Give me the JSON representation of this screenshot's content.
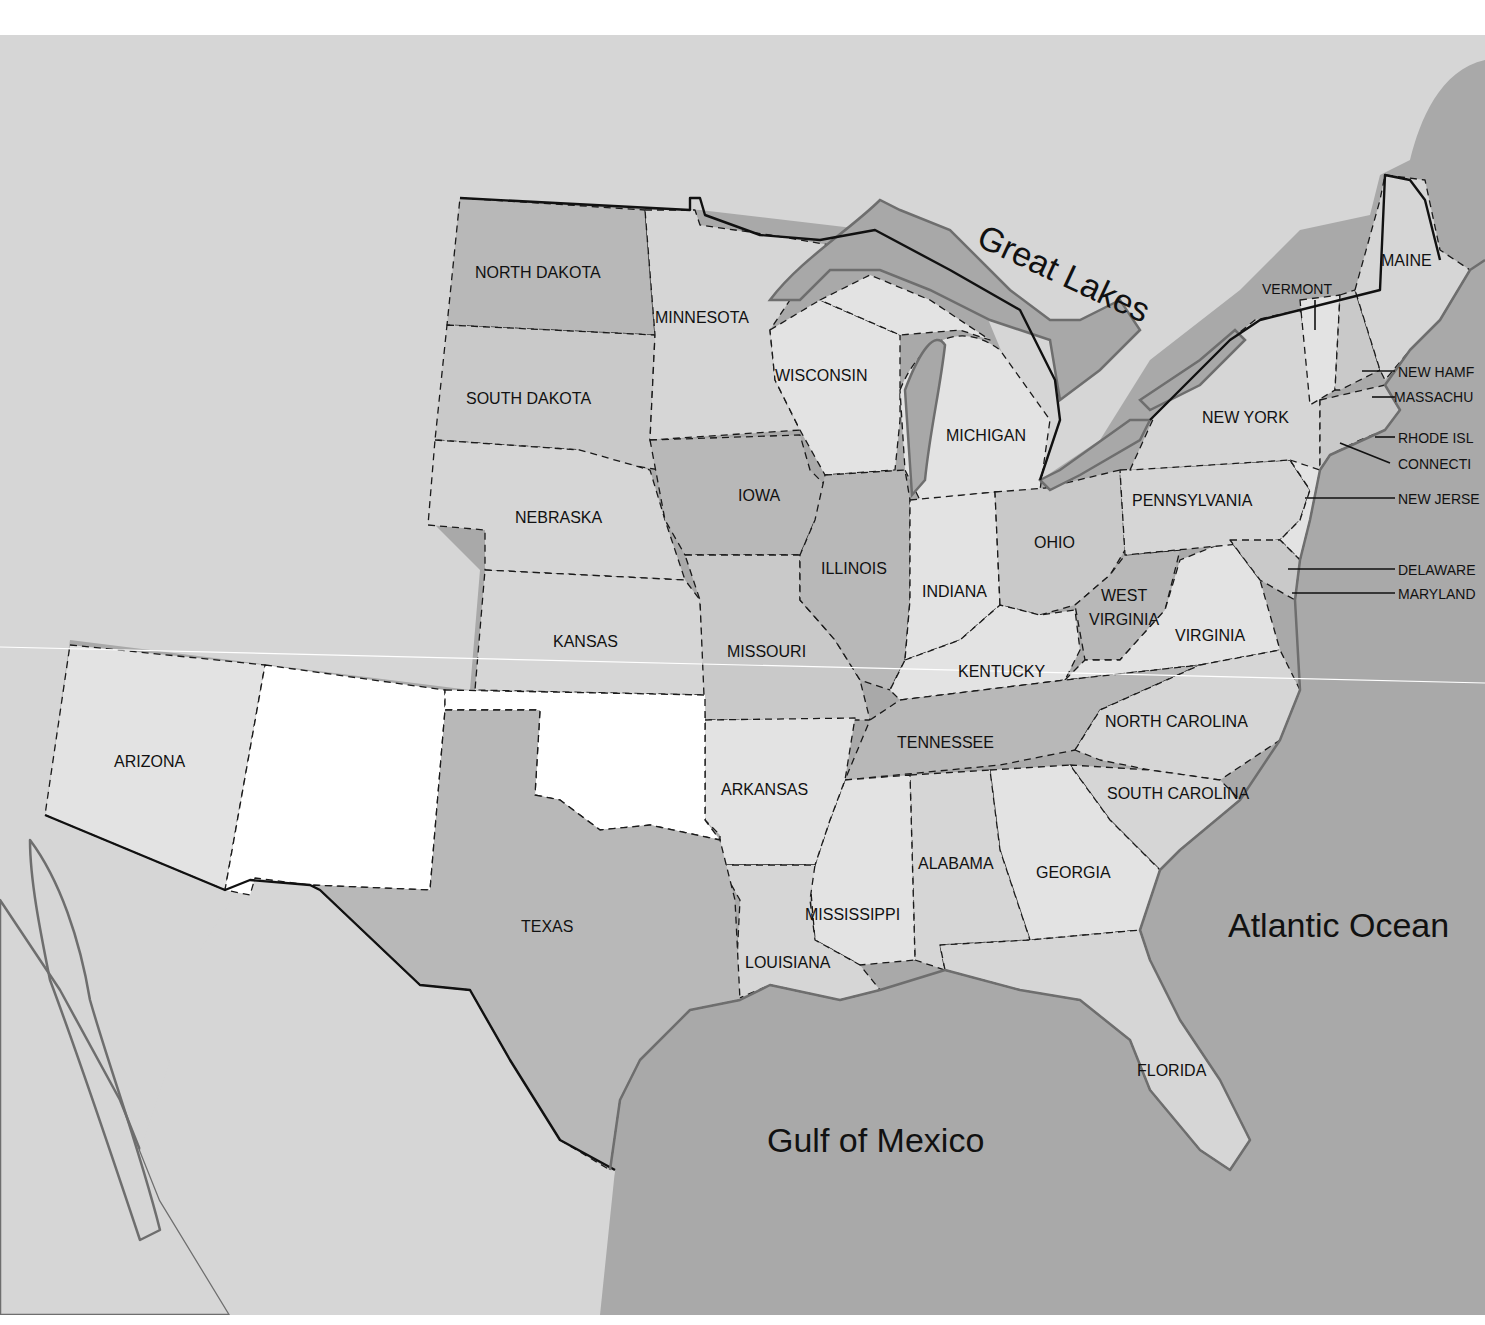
{
  "map": {
    "colors": {
      "water": "#a9a9a9",
      "land_foreign": "#d6d6d6",
      "state_dark": "#b8b8b8",
      "state_mid": "#c9c9c9",
      "state_light": "#e3e3e3",
      "state_white": "#ffffff",
      "lake": "#a8a8a8"
    },
    "water_labels": {
      "great_lakes": "Great Lakes",
      "atlantic": "Atlantic Ocean",
      "gulf": "Gulf of Mexico"
    },
    "states": [
      {
        "id": "north-dakota",
        "label": "NORTH DAKOTA"
      },
      {
        "id": "south-dakota",
        "label": "SOUTH DAKOTA"
      },
      {
        "id": "nebraska",
        "label": "NEBRASKA"
      },
      {
        "id": "kansas",
        "label": "KANSAS"
      },
      {
        "id": "minnesota",
        "label": "MINNESOTA"
      },
      {
        "id": "iowa",
        "label": "IOWA"
      },
      {
        "id": "missouri",
        "label": "MISSOURI"
      },
      {
        "id": "wisconsin",
        "label": "WISCONSIN"
      },
      {
        "id": "michigan",
        "label": "MICHIGAN"
      },
      {
        "id": "illinois",
        "label": "ILLINOIS"
      },
      {
        "id": "indiana",
        "label": "INDIANA"
      },
      {
        "id": "ohio",
        "label": "OHIO"
      },
      {
        "id": "kentucky",
        "label": "KENTUCKY"
      },
      {
        "id": "tennessee",
        "label": "TENNESSEE"
      },
      {
        "id": "arkansas",
        "label": "ARKANSAS"
      },
      {
        "id": "louisiana",
        "label": "LOUISIANA"
      },
      {
        "id": "mississippi",
        "label": "MISSISSIPPI"
      },
      {
        "id": "alabama",
        "label": "ALABAMA"
      },
      {
        "id": "georgia",
        "label": "GEORGIA"
      },
      {
        "id": "florida",
        "label": "FLORIDA"
      },
      {
        "id": "south-carolina",
        "label": "SOUTH CAROLINA"
      },
      {
        "id": "north-carolina",
        "label": "NORTH CAROLINA"
      },
      {
        "id": "virginia",
        "label": "VIRGINIA"
      },
      {
        "id": "west-virginia",
        "label_line1": "WEST",
        "label_line2": "VIRGINIA"
      },
      {
        "id": "pennsylvania",
        "label": "PENNSYLVANIA"
      },
      {
        "id": "new-york",
        "label": "NEW YORK"
      },
      {
        "id": "vermont",
        "label": "VERMONT"
      },
      {
        "id": "maine",
        "label": "MAINE"
      },
      {
        "id": "arizona",
        "label": "ARIZONA"
      },
      {
        "id": "texas",
        "label": "TEXAS"
      },
      {
        "id": "new-mexico",
        "label": ""
      },
      {
        "id": "oklahoma",
        "label": ""
      }
    ],
    "callouts": [
      {
        "id": "new-hampshire",
        "label": "NEW HAMF"
      },
      {
        "id": "massachusetts",
        "label": "MASSACHU"
      },
      {
        "id": "rhode-island",
        "label": "RHODE ISL"
      },
      {
        "id": "connecticut",
        "label": "CONNECTI"
      },
      {
        "id": "new-jersey",
        "label": "NEW JERSE"
      },
      {
        "id": "delaware",
        "label": "DELAWARE"
      },
      {
        "id": "maryland",
        "label": "MARYLAND"
      }
    ]
  }
}
